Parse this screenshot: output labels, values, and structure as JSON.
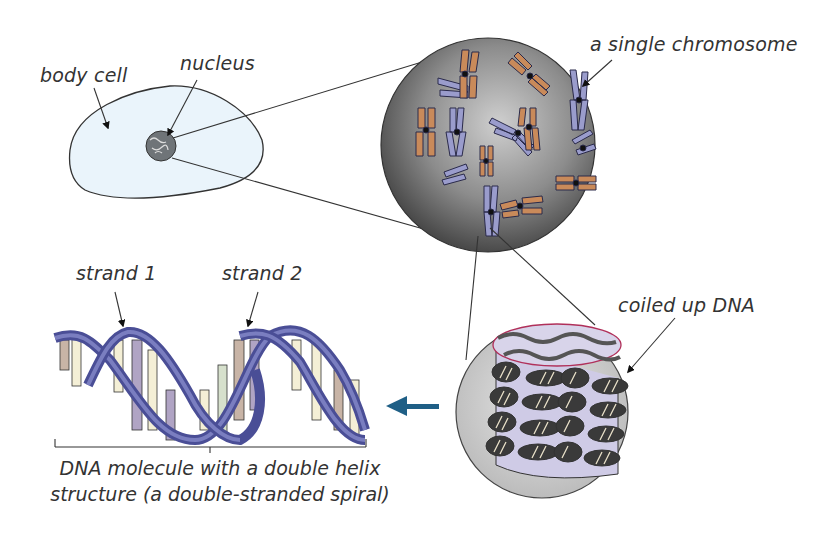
{
  "labels": {
    "body_cell": "body cell",
    "nucleus": "nucleus",
    "single_chromosome": "a single chromosome",
    "strand1": "strand 1",
    "strand2": "strand 2",
    "coiled_dna": "coiled up DNA"
  },
  "caption": {
    "line1": "DNA molecule with a double helix",
    "line2": "structure (a double-stranded spiral)"
  },
  "colors": {
    "cell_fill": "#eaf4fb",
    "chromosome_blue": "#9a9ccc",
    "helix_blue": "#5a5ea8",
    "arrow_teal": "#1f5f86",
    "sphere_gray": "#8a8a8a",
    "coil_ring": "#b0305a"
  }
}
